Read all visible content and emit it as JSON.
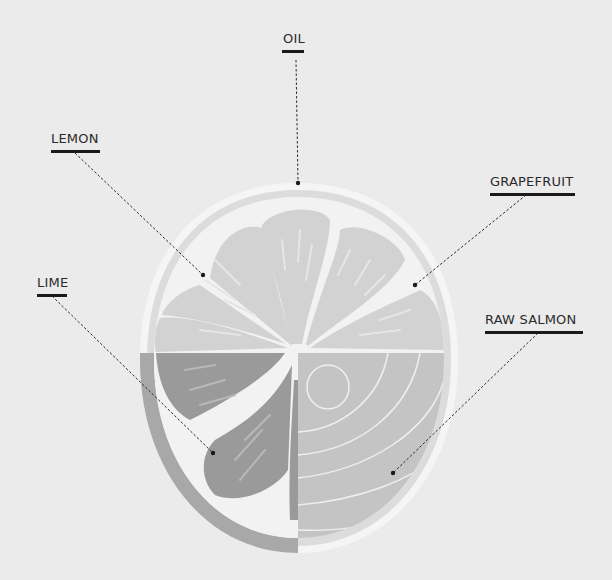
{
  "diagram": {
    "colors": {
      "background": "#ebebeb",
      "rind_outer": "#f5f5f5",
      "rind_band": "#dcdcdc",
      "lemon_segment": "#d2d2d2",
      "lemon_pith": "#f2f2f2",
      "lime_segment": "#9a9a9a",
      "lime_band": "#a8a8a8",
      "salmon": "#c4c4c4",
      "salmon_lines": "#efefef",
      "leader": "#2a2a2a"
    },
    "labels": [
      {
        "id": "oil",
        "text": "OIL"
      },
      {
        "id": "lemon",
        "text": "LEMON"
      },
      {
        "id": "grapefruit",
        "text": "GRAPEFRUIT"
      },
      {
        "id": "lime",
        "text": "LIME"
      },
      {
        "id": "raw_salmon",
        "text": "RAW SALMON"
      }
    ]
  }
}
